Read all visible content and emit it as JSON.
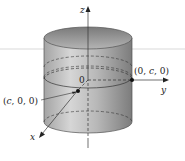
{
  "diagram": {
    "type": "3d-cylinder",
    "axes": {
      "z_label": "z",
      "y_label": "y",
      "x_label": "x"
    },
    "origin_label": "0",
    "points": [
      {
        "label": "(c, 0, 0)",
        "coord_text": "(c,0,0)"
      },
      {
        "label": "(0, c, 0)",
        "coord_text": "(0,c,0)"
      }
    ],
    "colors": {
      "cylinder_light": "#d9d9d9",
      "cylinder_dark": "#8f8f8f",
      "top_cap": "#a8a8a8",
      "line": "#333333",
      "background": "#ffffff"
    }
  }
}
